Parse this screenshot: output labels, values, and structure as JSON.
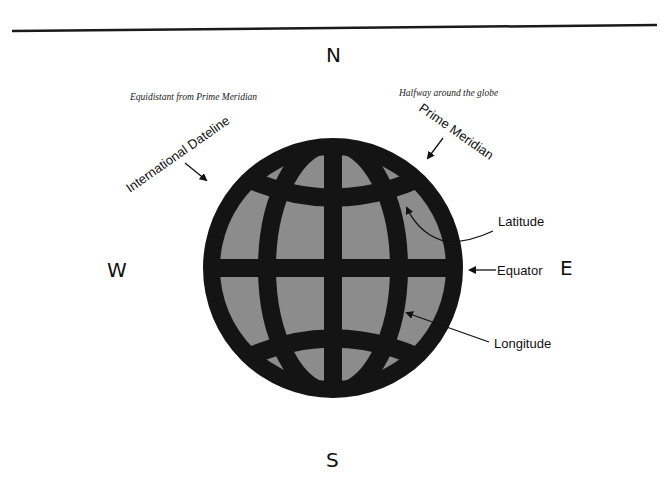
{
  "diagram": {
    "compass": {
      "north": "N",
      "south": "S",
      "east": "E",
      "west": "W"
    },
    "notes": {
      "left": "Equidistant from Prime Meridian",
      "right": "Halfway around the globe"
    },
    "labels": {
      "international_dateline": "International Dateline",
      "prime_meridian": "Prime Meridian",
      "latitude": "Latitude",
      "equator": "Equator",
      "longitude": "Longitude"
    },
    "colors": {
      "globe_outline": "#141414",
      "globe_fill": "#8c8c8c",
      "rule": "#1a1a1a"
    }
  }
}
